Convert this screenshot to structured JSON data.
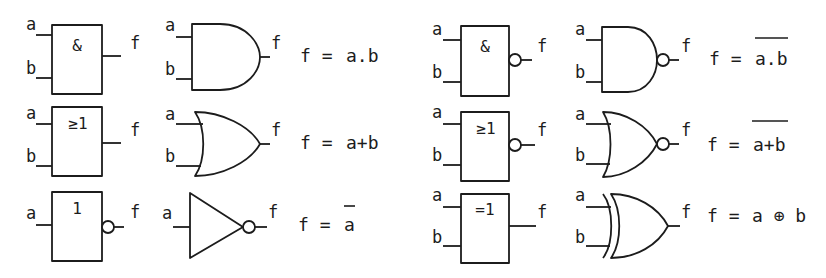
{
  "diagram": {
    "input_labels": {
      "a": "a",
      "b": "b"
    },
    "output_label": "f",
    "gates": [
      {
        "name": "AND",
        "iec_symbol": "&",
        "equation_lhs": "f =",
        "equation_rhs": "a.b",
        "overline": false
      },
      {
        "name": "OR",
        "iec_symbol": "≥1",
        "equation_lhs": "f =",
        "equation_rhs": "a+b",
        "overline": false
      },
      {
        "name": "NOT",
        "iec_symbol": "1",
        "equation_lhs": "f =",
        "equation_rhs": "a",
        "overline": true
      },
      {
        "name": "NAND",
        "iec_symbol": "&",
        "equation_lhs": "f =",
        "equation_rhs": "a.b",
        "overline": true
      },
      {
        "name": "NOR",
        "iec_symbol": "≥1",
        "equation_lhs": "f =",
        "equation_rhs": "a+b",
        "overline": true
      },
      {
        "name": "XOR",
        "iec_symbol": "=1",
        "equation_lhs": "f =",
        "equation_rhs": "a ⊕ b",
        "overline": false
      }
    ]
  }
}
